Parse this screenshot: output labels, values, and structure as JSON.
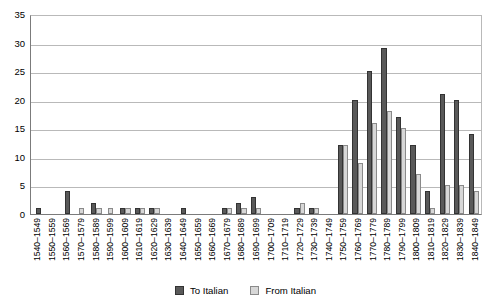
{
  "chart_data": {
    "type": "bar",
    "title": "",
    "subtitle": "",
    "xlabel": "",
    "ylabel": "",
    "ylim": [
      0,
      35
    ],
    "ytick_labels": [
      "0",
      "5",
      "10",
      "15",
      "20",
      "25",
      "30",
      "35"
    ],
    "ytick_values": [
      0,
      5,
      10,
      15,
      20,
      25,
      30,
      35
    ],
    "grid": true,
    "legend_position": "bottom",
    "categories": [
      "1540–1549",
      "1550–1559",
      "1560–1569",
      "1570–1579",
      "1580–1589",
      "1590–1599",
      "1600–1609",
      "1610–1619",
      "1620–1629",
      "1630–1639",
      "1640–1649",
      "1650–1659",
      "1660–1669",
      "1670–1679",
      "1680–1689",
      "1690–1699",
      "1700–1709",
      "1710–1719",
      "1720–1729",
      "1730–1739",
      "1740–1749",
      "1750–1759",
      "1760–1769",
      "1770–1779",
      "1780–1789",
      "1790–1799",
      "1800–1809",
      "1810–1819",
      "1820–1829",
      "1830–1839",
      "1840–1849"
    ],
    "series": [
      {
        "name": "To Italian",
        "color": "#595959",
        "values": [
          1,
          0,
          4,
          0,
          2,
          0,
          1,
          1,
          1,
          0,
          1,
          0,
          0,
          1,
          2,
          3,
          0,
          0,
          1,
          1,
          0,
          12,
          20,
          25,
          29,
          17,
          12,
          4,
          21,
          20,
          14
        ]
      },
      {
        "name": "From Italian",
        "color": "#d7d7d7",
        "values": [
          0,
          0,
          0,
          1,
          1,
          1,
          1,
          1,
          1,
          0,
          0,
          0,
          0,
          1,
          1,
          1,
          0,
          0,
          2,
          1,
          0,
          12,
          9,
          16,
          18,
          15,
          7,
          1,
          5,
          5,
          4
        ]
      }
    ]
  },
  "legend": {
    "items": [
      {
        "label": "To Italian",
        "swatch": "dark-square-swatch"
      },
      {
        "label": "From Italian",
        "swatch": "light-square-swatch"
      }
    ]
  }
}
